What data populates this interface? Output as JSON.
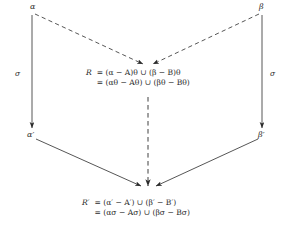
{
  "diagram": {
    "type": "commutative-diagram",
    "nodes": [
      {
        "id": "alpha",
        "label": "α",
        "position": "top-left"
      },
      {
        "id": "beta",
        "label": "β",
        "position": "top-right"
      },
      {
        "id": "alpha-prime",
        "label": "α′",
        "position": "bottom-left"
      },
      {
        "id": "beta-prime",
        "label": "β′",
        "position": "bottom-right"
      }
    ],
    "edge_labels": {
      "left_sigma": "σ",
      "right_sigma": "σ"
    },
    "equations": [
      {
        "id": "R",
        "lhs": "R",
        "lines": [
          "= (α − A)θ ∪ (β − B)θ",
          "= (αθ − Aθ) ∪ (βθ − Bθ)"
        ]
      },
      {
        "id": "R-prime",
        "lhs": "R′",
        "lines": [
          "= (α′ − A′) ∪ (β′ − B′)",
          "= (ασ − Aσ) ∪ (βσ − Bσ)"
        ]
      }
    ],
    "colors": {
      "stroke": "#2b2b2b",
      "text": "#2b2b2b",
      "background": "#ffffff"
    }
  }
}
